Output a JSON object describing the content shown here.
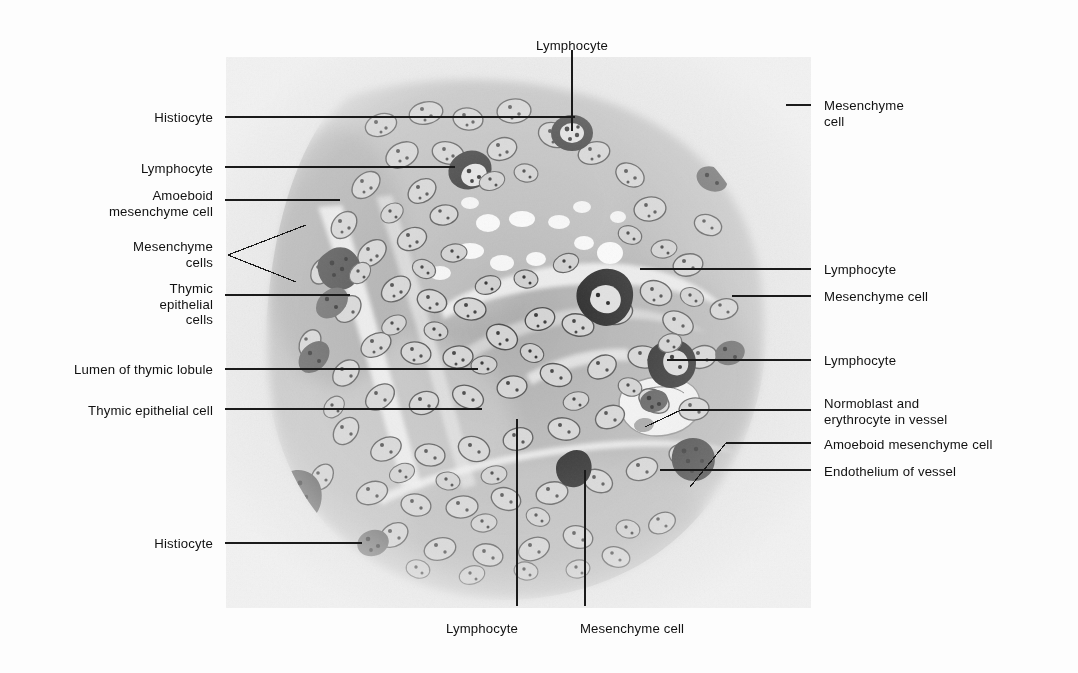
{
  "plate": {
    "background": "#fdfdfd",
    "panel": {
      "x": 226,
      "y": 57,
      "width": 585,
      "height": 551,
      "base_color": "#ececec"
    },
    "ink": "#111111"
  },
  "labels_left": [
    {
      "name": "histiocyte-top",
      "text": "Histiocyte",
      "x": 213,
      "y": 110,
      "lines": 1
    },
    {
      "name": "lymphocyte-left",
      "text": "Lymphocyte",
      "x": 213,
      "y": 161,
      "lines": 1
    },
    {
      "name": "amoeboid-mesenchyme",
      "text": "Amoeboid\nmesenchyme cell",
      "x": 213,
      "y": 188,
      "lines": 2
    },
    {
      "name": "mesenchyme-cells",
      "text": "Mesenchyme\ncells",
      "x": 213,
      "y": 239,
      "lines": 2
    },
    {
      "name": "thymic-epithelial-cells",
      "text": "Thymic\nepithelial\ncells",
      "x": 213,
      "y": 281,
      "lines": 3
    },
    {
      "name": "lumen-thymic-lobule",
      "text": "Lumen of thymic lobule",
      "x": 213,
      "y": 362,
      "lines": 1
    },
    {
      "name": "thymic-epithelial-cell",
      "text": "Thymic epithelial cell",
      "x": 213,
      "y": 403,
      "lines": 1
    },
    {
      "name": "histiocyte-bottom",
      "text": "Histiocyte",
      "x": 213,
      "y": 536,
      "lines": 1
    }
  ],
  "labels_right": [
    {
      "name": "mesenchyme-cell-top",
      "text": "Mesenchyme\ncell",
      "x": 824,
      "y": 98,
      "lines": 2
    },
    {
      "name": "lymphocyte-right-1",
      "text": "Lymphocyte",
      "x": 824,
      "y": 262,
      "lines": 1
    },
    {
      "name": "mesenchyme-cell-right",
      "text": "Mesenchyme cell",
      "x": 824,
      "y": 289,
      "lines": 1
    },
    {
      "name": "lymphocyte-right-2",
      "text": "Lymphocyte",
      "x": 824,
      "y": 353,
      "lines": 1
    },
    {
      "name": "normoblast-erythrocyte",
      "text": "Normoblast and\nerythrocyte in vessel",
      "x": 824,
      "y": 396,
      "lines": 2
    },
    {
      "name": "amoeboid-mesenchyme-r",
      "text": "Amoeboid mesenchyme cell",
      "x": 824,
      "y": 437,
      "lines": 1
    },
    {
      "name": "endothelium-of-vessel",
      "text": "Endothelium of vessel",
      "x": 824,
      "y": 464,
      "lines": 1
    }
  ],
  "labels_top": [
    {
      "name": "lymphocyte-top",
      "text": "Lymphocyte",
      "x": 572,
      "y": 38
    }
  ],
  "labels_bottom": [
    {
      "name": "lymphocyte-bottom",
      "text": "Lymphocyte",
      "x": 482,
      "y": 621
    },
    {
      "name": "mesenchyme-cell-bottom",
      "text": "Mesenchyme cell",
      "x": 632,
      "y": 621
    }
  ],
  "leaders": [
    {
      "name": "leader-histiocyte-top",
      "type": "poly",
      "points": "225,117 575,117"
    },
    {
      "name": "leader-lymphocyte-left",
      "type": "poly",
      "points": "225,167 382,167 455,167"
    },
    {
      "name": "leader-amoeboid-mesenchyme",
      "type": "poly",
      "points": "225,200 340,200"
    },
    {
      "name": "leader-mesenchyme-cells-a",
      "type": "poly",
      "points": "228,255 306,225"
    },
    {
      "name": "leader-mesenchyme-cells-b",
      "type": "poly",
      "points": "228,255 296,282"
    },
    {
      "name": "leader-thymic-epithelial-cells",
      "type": "poly",
      "points": "225,295 350,295"
    },
    {
      "name": "leader-lumen-thymic-lobule",
      "type": "poly",
      "points": "225,369 478,369"
    },
    {
      "name": "leader-thymic-epithelial-cell",
      "type": "poly",
      "points": "225,409 482,409"
    },
    {
      "name": "leader-histiocyte-bottom",
      "type": "poly",
      "points": "225,543 362,543"
    },
    {
      "name": "leader-mesenchyme-cell-top",
      "type": "poly",
      "points": "811,105 786,105"
    },
    {
      "name": "leader-lymphocyte-right-1",
      "type": "poly",
      "points": "811,269 640,269"
    },
    {
      "name": "leader-mesenchyme-cell-right",
      "type": "poly",
      "points": "811,296 732,296"
    },
    {
      "name": "leader-lymphocyte-right-2",
      "type": "poly",
      "points": "811,360 667,360"
    },
    {
      "name": "leader-normoblast",
      "type": "poly",
      "points": "811,410 681,410 645,427"
    },
    {
      "name": "leader-amoeboid-mesenchyme-r",
      "type": "poly",
      "points": "811,443 726,443 690,487"
    },
    {
      "name": "leader-endothelium",
      "type": "poly",
      "points": "811,470 660,470"
    },
    {
      "name": "leader-lymphocyte-top",
      "type": "poly",
      "points": "572,50 572,131"
    },
    {
      "name": "leader-lymphocyte-bottom",
      "type": "poly",
      "points": "517,606 517,419"
    },
    {
      "name": "leader-mesenchyme-cell-bottom",
      "type": "poly",
      "points": "585,606 585,470"
    }
  ]
}
